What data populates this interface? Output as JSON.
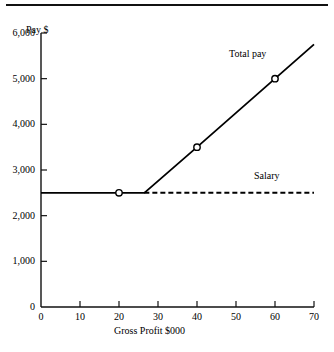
{
  "chart_data": {
    "type": "line",
    "title": "",
    "xlabel": "Gross Profit $000",
    "ylabel": "Pay $",
    "xlim": [
      0,
      70
    ],
    "ylim": [
      0,
      6000
    ],
    "xticks": [
      "0",
      "10",
      "20",
      "30",
      "40",
      "50",
      "60",
      "70"
    ],
    "xtick_values": [
      0,
      10,
      20,
      30,
      40,
      50,
      60,
      70
    ],
    "yticks": [
      "0",
      "1,000",
      "2,000",
      "3,000",
      "4,000",
      "5,000",
      "6,000"
    ],
    "ytick_values": [
      0,
      1000,
      2000,
      3000,
      4000,
      5000,
      6000
    ],
    "grid": false,
    "legend_position": "inline-annotation",
    "series": [
      {
        "name": "Total pay",
        "style": "solid",
        "color": "#000000",
        "x": [
          0,
          20,
          26.5,
          40,
          60,
          70
        ],
        "values": [
          2500,
          2500,
          2500,
          3500,
          5000,
          5750
        ],
        "markers_x": [
          20,
          40,
          60
        ],
        "markers_y": [
          2500,
          3500,
          5000
        ]
      },
      {
        "name": "Salary",
        "style": "dashed",
        "color": "#000000",
        "x": [
          26.5,
          70
        ],
        "values": [
          2500,
          2500
        ],
        "markers_x": [],
        "markers_y": []
      }
    ],
    "annotations": [
      {
        "text": "Total pay",
        "x": 48.8,
        "y": 5560
      },
      {
        "text": "Salary",
        "x": 55.5,
        "y": 2890
      }
    ]
  }
}
